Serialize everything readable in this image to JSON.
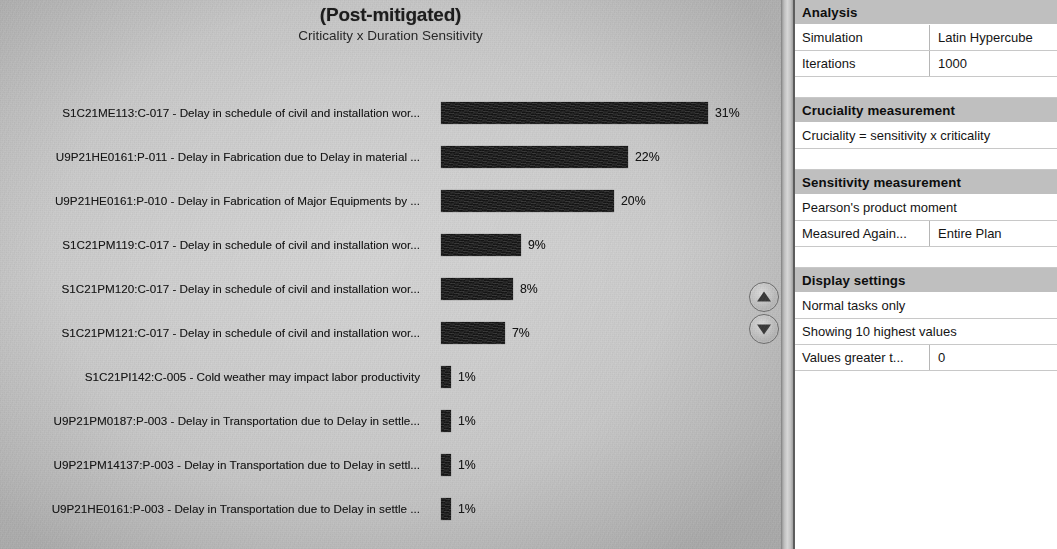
{
  "chart": {
    "title": "(Post-mitigated)",
    "subtitle": "Criticality x Duration Sensitivity"
  },
  "controls": {
    "scroll_up": "scroll-up",
    "scroll_down": "scroll-down"
  },
  "side_panel": {
    "analysis": {
      "heading": "Analysis",
      "rows": [
        {
          "key": "Simulation",
          "value": "Latin Hypercube"
        },
        {
          "key": "Iterations",
          "value": "1000"
        }
      ]
    },
    "cruciality": {
      "heading": "Cruciality measurement",
      "rows": [
        {
          "key": "Cruciality = sensitivity x criticality",
          "value": ""
        }
      ]
    },
    "sensitivity": {
      "heading": "Sensitivity measurement",
      "rows": [
        {
          "key": "Pearson's product moment",
          "value": ""
        },
        {
          "key": "Measured Again...",
          "value": "Entire Plan"
        }
      ]
    },
    "display": {
      "heading": "Display settings",
      "rows": [
        {
          "key": "Normal tasks only",
          "value": ""
        },
        {
          "key": "Showing 10 highest values",
          "value": ""
        },
        {
          "key": "Values greater t...",
          "value": "0"
        }
      ]
    }
  },
  "chart_data": {
    "type": "bar",
    "orientation": "horizontal",
    "title": "(Post-mitigated)",
    "subtitle": "Criticality x Duration Sensitivity",
    "xlabel": "",
    "ylabel": "",
    "xlim": [
      0,
      35
    ],
    "grid": false,
    "legend": null,
    "value_suffix": "%",
    "bar_color": "#141414",
    "categories": [
      "S1C21ME113:C-017 - Delay in schedule of civil and installation wor...",
      "U9P21HE0161:P-011 - Delay in Fabrication due to Delay in material ...",
      "U9P21HE0161:P-010 - Delay in Fabrication of Major Equipments by ...",
      "S1C21PM119:C-017 - Delay in schedule of civil and installation wor...",
      "S1C21PM120:C-017 - Delay in schedule of civil and installation wor...",
      "S1C21PM121:C-017 - Delay in schedule of civil and installation wor...",
      "S1C21PI142:C-005 - Cold weather may impact labor productivity",
      "U9P21PM0187:P-003 - Delay in Transportation due to Delay in settle...",
      "U9P21PM14137:P-003 - Delay in Transportation due to Delay in settl...",
      "U9P21HE0161:P-003 - Delay in Transportation due to Delay in settle ..."
    ],
    "values": [
      31,
      22,
      20,
      9,
      8,
      7,
      1,
      1,
      1,
      1
    ],
    "value_labels": [
      "31%",
      "22%",
      "20%",
      "9%",
      "8%",
      "7%",
      "1%",
      "1%",
      "1%",
      "1%"
    ],
    "bar_pixel_widths": [
      267,
      187,
      173,
      80,
      72,
      64,
      10,
      10,
      10,
      10
    ],
    "row_tops": [
      100,
      144,
      188,
      232,
      276,
      320,
      364,
      408,
      452,
      496
    ]
  }
}
